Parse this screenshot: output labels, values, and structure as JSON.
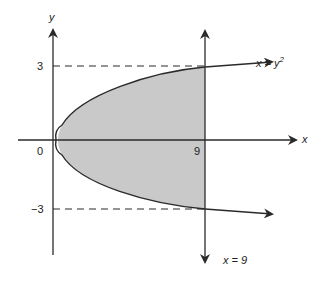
{
  "diagram": {
    "colors": {
      "background": "#ffffff",
      "stroke": "#2a2a2a",
      "fill": "#c9c9c9"
    },
    "axes": {
      "x_label": "x",
      "y_label": "y",
      "origin_label": "0"
    },
    "ticks": {
      "y_top": "3",
      "y_bottom": "−3",
      "x_nine": "9"
    },
    "curves": {
      "parabola": {
        "label_prefix": "x = y",
        "label_exp": "2",
        "equation": "x = y^2"
      },
      "vertical_line": {
        "label": "x = 9",
        "equation": "x = 9"
      }
    },
    "shaded_region": "Area between x = y^2 and x = 9, for -3 ≤ y ≤ 3",
    "guides": [
      "dashed y = 3",
      "dashed y = -3"
    ]
  }
}
